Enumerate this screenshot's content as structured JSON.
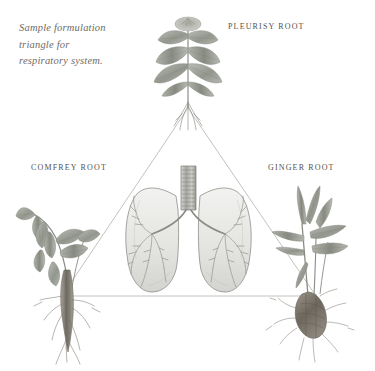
{
  "page": {
    "background_color": "#ffffff",
    "width": 375,
    "height": 371,
    "type": "botanical-formulation-diagram"
  },
  "caption": {
    "line1": "Sample formulation",
    "line2": "triangle for",
    "line3": "respiratory system.",
    "color": "#6f6b66",
    "style": "italic-serif"
  },
  "labels": {
    "top": "PLEURISY ROOT",
    "left": "COMFREY ROOT",
    "right": "GINGER ROOT",
    "color": "#55524e"
  },
  "diagram": {
    "shape": "triangle",
    "line_color": "#b4b2ae",
    "line_width": "0.8",
    "vertices": {
      "apex": [
        188,
        108
      ],
      "left": [
        62,
        296
      ],
      "right": [
        316,
        296
      ]
    },
    "center_subject": "human-lungs-with-trachea-and-bronchial-tree"
  },
  "illustrations": {
    "pleurisy_root": {
      "name": "pleurisy-root-plant",
      "position": [
        188,
        12
      ],
      "description": "upright stem with broad opposite lance-shaped leaves, flower cluster at top, fine taproot below"
    },
    "comfrey_root": {
      "name": "comfrey-root-plant",
      "position": [
        20,
        205
      ],
      "description": "arching stem with large hairy leaves and thick branching taproot"
    },
    "ginger_root": {
      "name": "ginger-root-plant",
      "position": [
        288,
        188
      ],
      "description": "narrow blade leaves rising from a knobby rhizome with fine roots"
    },
    "lungs": {
      "name": "lungs-illustration",
      "position": [
        130,
        165
      ],
      "description": "pair of lungs in pencil shading with segmented trachea and branching bronchi"
    }
  },
  "palette": {
    "pencil_dark": "#6b6b68",
    "pencil_mid": "#9a9a95",
    "pencil_light": "#c9c9c4",
    "leaf_tone": "#8e9188",
    "root_tone": "#7d7872"
  }
}
